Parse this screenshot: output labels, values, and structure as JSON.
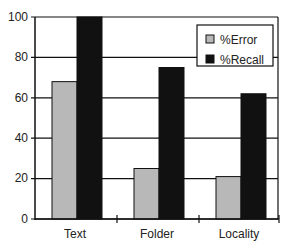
{
  "chart_data": {
    "type": "bar",
    "title": "",
    "xlabel": "",
    "ylabel": "",
    "categories": [
      "Text",
      "Folder",
      "Locality"
    ],
    "series": [
      {
        "name": "%Error",
        "color": "#b8b8b8",
        "values": [
          68,
          25,
          21
        ]
      },
      {
        "name": "%Recall",
        "color": "#111111",
        "values": [
          100,
          75,
          62
        ]
      }
    ],
    "ylim": [
      0,
      100
    ],
    "yticks": [
      0,
      20,
      40,
      60,
      80,
      100
    ],
    "grid": true,
    "legend_position": "upper right"
  },
  "legend": {
    "items": [
      {
        "label": "%Error"
      },
      {
        "label": "%Recall"
      }
    ]
  },
  "axis": {
    "y_ticks": [
      "0",
      "20",
      "40",
      "60",
      "80",
      "100"
    ]
  }
}
